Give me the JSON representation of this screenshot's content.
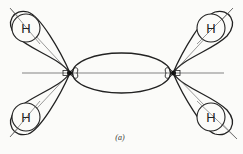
{
  "diagram": {
    "caption": "(a)",
    "atoms": [
      {
        "label": "H",
        "position": "top-left"
      },
      {
        "label": "H",
        "position": "bottom-left"
      },
      {
        "label": "H",
        "position": "top-right"
      },
      {
        "label": "H",
        "position": "bottom-right"
      }
    ],
    "centers": [
      "left-carbon",
      "right-carbon"
    ],
    "colors": {
      "line": "#222222",
      "background": "#fbfbf9"
    }
  }
}
